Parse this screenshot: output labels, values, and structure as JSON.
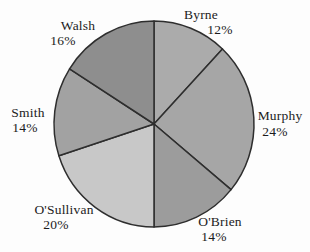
{
  "chart_data": {
    "type": "pie",
    "title": "",
    "start_angle_deg": 0,
    "direction": "clockwise",
    "legend": "none",
    "labels_position": "outside",
    "unit": "%",
    "categories": [
      "Byrne",
      "Murphy",
      "O'Brien",
      "O'Sullivan",
      "Smith",
      "Walsh"
    ],
    "values": [
      12,
      24,
      14,
      20,
      14,
      16
    ],
    "segments": [
      {
        "label": "Byrne",
        "value": 12,
        "pct_label": "12%",
        "color": "#ababab"
      },
      {
        "label": "Murphy",
        "value": 24,
        "pct_label": "24%",
        "color": "#a6a6a6"
      },
      {
        "label": "O'Brien",
        "value": 14,
        "pct_label": "14%",
        "color": "#9c9c9c"
      },
      {
        "label": "O'Sullivan",
        "value": 20,
        "pct_label": "20%",
        "color": "#c8c8c8"
      },
      {
        "label": "Smith",
        "value": 14,
        "pct_label": "14%",
        "color": "#a2a2a2"
      },
      {
        "label": "Walsh",
        "value": 16,
        "pct_label": "16%",
        "color": "#8e8e8e"
      }
    ],
    "outline_color": "#2e2e2e",
    "text_color": "#1c1c1c"
  }
}
